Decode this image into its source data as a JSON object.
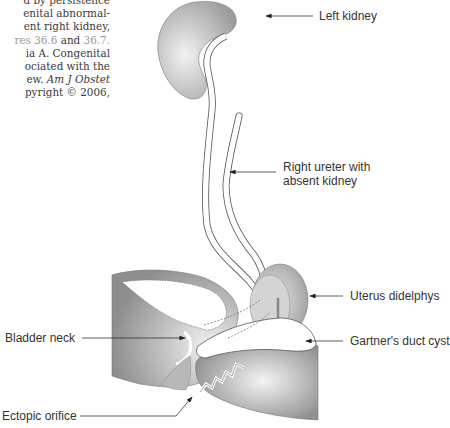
{
  "caption": {
    "lines": [
      "d by persistence",
      "enital abnormal-",
      "ent right kidney,",
      "and",
      "ia A. Congenital",
      "ociated with the",
      "ew.",
      "pyright © 2006,"
    ],
    "ref_prefix": "res 36.6",
    "ref_suffix": "36.7.",
    "journal_italic": "Am J Obstet"
  },
  "labels": {
    "left_kidney": "Left kidney",
    "right_ureter_line1": "Right ureter with",
    "right_ureter_line2": "absent kidney",
    "uterus": "Uterus didelphys",
    "bladder_neck": "Bladder neck",
    "gartner": "Gartner's duct cyst",
    "ectopic": "Ectopic orifice"
  },
  "colors": {
    "organ_gray": "#9a9a9a",
    "organ_light": "#e6e6e6",
    "line": "#444444",
    "text": "#333333"
  }
}
